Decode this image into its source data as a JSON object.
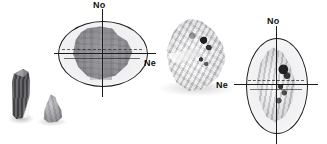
{
  "figure": {
    "background_color": "#ffffff",
    "axis_color": "#1b1b1b",
    "label_color": "#111111"
  },
  "specimens": [
    {
      "id": "crystal-fragment-prismatic",
      "kind": "bare-crystal",
      "description": "dark elongated prismatic crystal fragment",
      "has_indicatrix": false
    },
    {
      "id": "crystal-fragment-rounded",
      "kind": "bare-crystal",
      "description": "small rounded grey crystal fragment",
      "has_indicatrix": false
    },
    {
      "id": "crystal-indicatrix-horizontal",
      "kind": "crystal-with-indicatrix",
      "description": "dark grey crystal within horizontally elongated indicatrix ellipse",
      "has_indicatrix": true,
      "ellipse_orientation": "horizontal",
      "axes": [
        {
          "name": "optic-axis-no",
          "label": "No",
          "position": "top",
          "direction": "vertical"
        },
        {
          "name": "optic-axis-ne",
          "label": "Ne",
          "position": "right",
          "direction": "horizontal"
        }
      ]
    },
    {
      "id": "crystal-bright-inclusions",
      "kind": "bare-crystal",
      "description": "bright translucent crystal with dark inclusions",
      "has_indicatrix": false
    },
    {
      "id": "crystal-indicatrix-vertical",
      "kind": "crystal-with-indicatrix",
      "description": "bright crystal with dark inclusions within vertically elongated indicatrix ellipse",
      "has_indicatrix": true,
      "ellipse_orientation": "vertical",
      "axes": [
        {
          "name": "optic-axis-no",
          "label": "No",
          "position": "top",
          "direction": "vertical"
        },
        {
          "name": "optic-axis-ne",
          "label": "Ne",
          "position": "left",
          "direction": "horizontal"
        }
      ]
    }
  ]
}
